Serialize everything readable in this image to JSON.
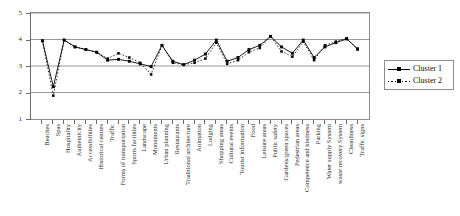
{
  "chart_data": {
    "type": "line",
    "title": "",
    "xlabel": "",
    "ylabel": "",
    "ylim": [
      1,
      5
    ],
    "yticks": [
      1,
      2,
      3,
      4,
      5
    ],
    "grid": true,
    "legend_position": "right",
    "categories": [
      "Beaches",
      "Spas",
      "Hospitality",
      "Authenticity",
      "Accessibilities",
      "Historical centres",
      "Traffic",
      "Forms of transportation",
      "Sports facilities",
      "Landscape",
      "Monuments",
      "Urban planning",
      "Restaurants",
      "Traditional architecture",
      "Animation",
      "Lodging",
      "Shopping areas",
      "Cultural events",
      "Tourist information",
      "Food",
      "Leisure areas",
      "Public safety",
      "Gardens/green spaces",
      "Pedestrian areas",
      "Competence and kindness",
      "Parking",
      "Water supply System",
      "waste recovery System",
      "Cleanliness",
      "Traffic signs"
    ],
    "series": [
      {
        "name": "Cluster 1",
        "style": "solid",
        "values": [
          3.95,
          2.22,
          3.98,
          3.72,
          3.62,
          3.52,
          3.22,
          3.25,
          3.18,
          3.08,
          2.98,
          3.78,
          3.18,
          3.05,
          3.22,
          3.45,
          3.98,
          3.18,
          3.32,
          3.62,
          3.78,
          4.12,
          3.72,
          3.48,
          3.98,
          3.32,
          3.72,
          3.88,
          4.02,
          3.65
        ]
      },
      {
        "name": "Cluster 2",
        "style": "dotted",
        "values": [
          3.95,
          1.88,
          3.98,
          3.72,
          3.62,
          3.52,
          3.28,
          3.48,
          3.32,
          3.12,
          2.68,
          3.78,
          3.12,
          3.05,
          3.12,
          3.28,
          3.88,
          3.08,
          3.22,
          3.52,
          3.68,
          4.12,
          3.55,
          3.35,
          3.92,
          3.22,
          3.78,
          3.92,
          4.05,
          3.62
        ]
      }
    ]
  },
  "legend": {
    "items": [
      {
        "label": "Cluster 1"
      },
      {
        "label": "Cluster 2"
      }
    ]
  },
  "colors": {
    "series_1": "#000000",
    "series_2": "#000000",
    "grid": "#8c8c8c",
    "axis": "#6b6b6b",
    "text": "#2b2b2b"
  }
}
